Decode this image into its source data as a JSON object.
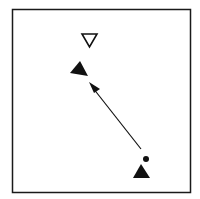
{
  "diagram": {
    "colors": {
      "background": "#ffffff",
      "frame": "#1a1a1a",
      "ink": "#111111"
    },
    "frame": {
      "x": 12,
      "y": 9,
      "width": 178,
      "height": 183
    },
    "elements": [
      {
        "id": "open-inverted-triangle",
        "type": "triangle-down-open",
        "center": [
          89,
          40
        ]
      },
      {
        "id": "upper-filled-triangle",
        "type": "triangle-filled",
        "points": [
          [
            80,
            61
          ],
          [
            70,
            73
          ],
          [
            88,
            76
          ]
        ]
      },
      {
        "id": "movement-arrow",
        "type": "arrow",
        "from": [
          141,
          149
        ],
        "to": [
          89,
          83
        ]
      },
      {
        "id": "marker-dot",
        "type": "dot",
        "center": [
          146,
          159
        ],
        "radius": 3
      },
      {
        "id": "lower-filled-triangle",
        "type": "triangle-filled",
        "points": [
          [
            141,
            164
          ],
          [
            133,
            178
          ],
          [
            150,
            178
          ]
        ]
      }
    ]
  }
}
